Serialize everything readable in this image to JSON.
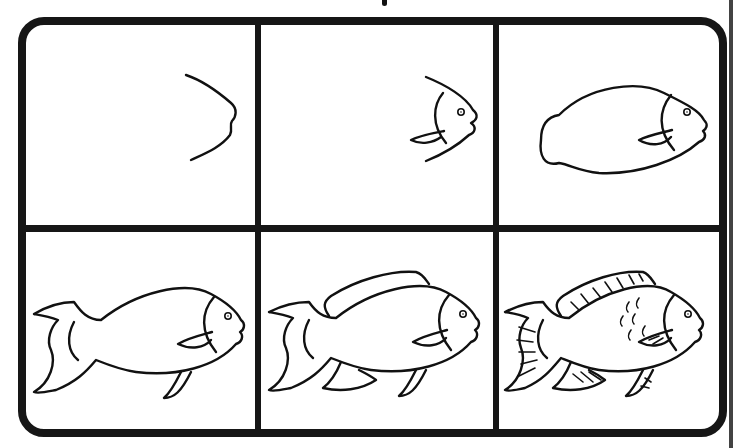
{
  "layout": {
    "rows": 2,
    "columns": 3,
    "border_color": "#161616",
    "background": "#ffffff"
  },
  "panels": [
    {
      "step": 1,
      "description": "Curved chevron line forming the fish head and mouth"
    },
    {
      "step": 2,
      "description": "Head with eye, gill line and pectoral fin"
    },
    {
      "step": 3,
      "description": "Body outline closed into a rounded tail stub"
    },
    {
      "step": 4,
      "description": "Forked tail fin and pelvic fin added"
    },
    {
      "step": 5,
      "description": "Dorsal fin and lower anal fin added"
    },
    {
      "step": 6,
      "description": "Finished fish with fin rays and scale marks"
    }
  ]
}
